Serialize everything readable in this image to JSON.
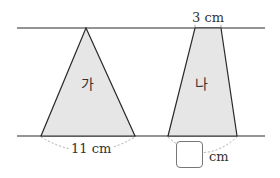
{
  "diagram": {
    "shapes": [
      {
        "id": "ga",
        "label": "가",
        "type": "triangle",
        "base_label": "11 cm"
      },
      {
        "id": "na",
        "label": "나",
        "type": "trapezoid",
        "top_label": "3 cm",
        "bottom_unit": "cm",
        "bottom_value": ""
      }
    ],
    "colors": {
      "fill": "#e6e6e6",
      "stroke": "#2a2a2a",
      "dashed": "#aaaaaa"
    }
  }
}
